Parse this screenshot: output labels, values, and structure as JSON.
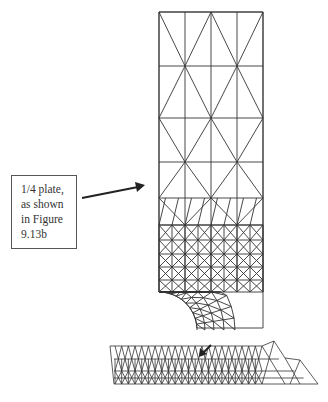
{
  "figure": {
    "type": "finite element mesh diagram",
    "callout": {
      "lines": [
        "1/4 plate,",
        "as shown",
        "in Figure",
        "9.13b"
      ]
    },
    "plate": {
      "x": [
        159,
        185,
        211,
        237,
        263
      ],
      "coarse_rows_y": [
        12,
        66,
        118,
        162,
        198,
        225
      ],
      "fine_rows_y": [
        225,
        240,
        254,
        267,
        280,
        292
      ],
      "hole_center": [
        159,
        330
      ],
      "hole_radius": 38
    },
    "strip": {
      "top_y": 346,
      "bottom_y": 384,
      "left_x": 114,
      "right_x": 318
    },
    "colors": {
      "line": "#333333",
      "background": "#ffffff"
    }
  }
}
